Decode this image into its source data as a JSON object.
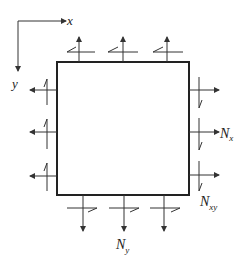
{
  "diagram": {
    "type": "plate-element-force-diagram",
    "axes": {
      "x_label": "x",
      "y_label": "y"
    },
    "labels": {
      "normal_x": {
        "base": "N",
        "sub": "x"
      },
      "shear_xy": {
        "base": "N",
        "sub": "xy"
      },
      "normal_y": {
        "base": "N",
        "sub": "y"
      }
    },
    "element": {
      "shape": "square",
      "edges": 4
    },
    "arrows_per_edge": 3,
    "colors": {
      "stroke": "#333333",
      "element_edge": "#222222",
      "background": "#ffffff"
    }
  }
}
